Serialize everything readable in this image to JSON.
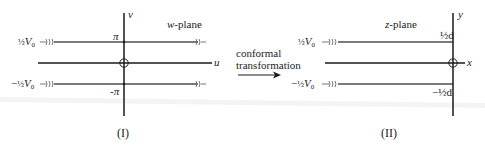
{
  "panels": [
    {
      "id": "I",
      "caption": "(I)",
      "plane_label": "w-plane",
      "plane_var": "w",
      "plane_suffix": "-plane",
      "axis_h": "u",
      "axis_v": "v",
      "upper_tick": "π",
      "lower_tick": "-π",
      "upper_potential": {
        "sign": "",
        "frac": "½",
        "sym": "V",
        "sub": "0"
      },
      "lower_potential": {
        "sign": "−",
        "frac": "½",
        "sym": "V",
        "sub": "0"
      }
    },
    {
      "id": "II",
      "caption": "(II)",
      "plane_label": "z-plane",
      "plane_var": "z",
      "plane_suffix": "-plane",
      "axis_h": "x",
      "axis_v": "y",
      "upper_tick": "½d",
      "lower_tick": "−½d",
      "upper_potential": {
        "sign": "",
        "frac": "½",
        "sym": "V",
        "sub": "0"
      },
      "lower_potential": {
        "sign": "−",
        "frac": "½",
        "sym": "V",
        "sub": "0"
      }
    }
  ],
  "arrow": {
    "line1": "conformal",
    "line2": "transformation"
  },
  "colors": {
    "axis": "#1a1a1a",
    "plate": "#777777",
    "text": "#222222"
  }
}
